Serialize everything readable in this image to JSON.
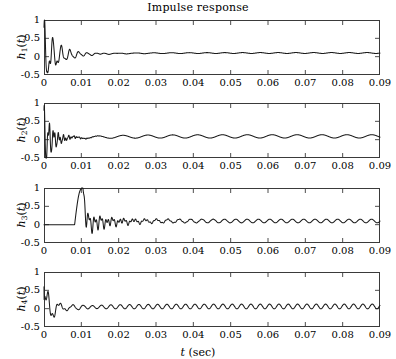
{
  "figure": {
    "title": "Impulse response",
    "xlabel_var": "t",
    "xlabel_unit": "(sec)",
    "line_color": "#1a1a1a",
    "axis_color": "#3a3a3a",
    "background": "#ffffff"
  },
  "axes": {
    "xticklabels": [
      "0",
      "0.01",
      "0.02",
      "0.03",
      "0.04",
      "0.05",
      "0.06",
      "0.07",
      "0.08",
      "0.09"
    ],
    "xtickvalues": [
      0,
      0.01,
      0.02,
      0.03,
      0.04,
      0.05,
      0.06,
      0.07,
      0.08,
      0.09
    ],
    "yticklabels": [
      "1",
      "0.5",
      "0",
      "-0.5"
    ],
    "ytickvalues": [
      1,
      0.5,
      0,
      -0.5
    ],
    "xlim": [
      0,
      0.09
    ],
    "ylim": [
      -0.5,
      1
    ]
  },
  "panels": [
    {
      "label_base": "h",
      "label_sub": "1",
      "label_var": "t",
      "name": "h1"
    },
    {
      "label_base": "h",
      "label_sub": "2",
      "label_var": "t",
      "name": "h2"
    },
    {
      "label_base": "h",
      "label_sub": "3",
      "label_var": "t",
      "name": "h3"
    },
    {
      "label_base": "h",
      "label_sub": "4",
      "label_var": "t",
      "name": "h4"
    }
  ],
  "chart_data": {
    "type": "line",
    "title": "Impulse response",
    "xlabel": "t (sec)",
    "ylabel": "h_i(t)",
    "xlim": [
      0,
      0.09
    ],
    "ylim": [
      -0.5,
      1
    ],
    "grid": false,
    "legend": "none",
    "n_subplots": 4,
    "shared_x": true,
    "x_tick_labels": [
      "0",
      "0.01",
      "0.02",
      "0.03",
      "0.04",
      "0.05",
      "0.06",
      "0.07",
      "0.08",
      "0.09"
    ],
    "y_tick_labels": [
      "1",
      "0.5",
      "0",
      "-0.5"
    ],
    "series": [
      {
        "name": "h1(t)",
        "ylabel": "h_1(t)",
        "description": "Damped oscillatory impulse response starting near 0.8, decaying to a small steady ripple near 0.1",
        "model": {
          "onset": 0.0,
          "initial_value": 0.8,
          "components": [
            {
              "amp": 0.62,
              "freq_hz": 430,
              "decay_tau": 0.0042,
              "phase": 1.5708
            },
            {
              "amp": 0.34,
              "freq_hz": 900,
              "decay_tau": 0.003,
              "phase": 0.6
            },
            {
              "amp": 0.16,
              "freq_hz": 1500,
              "decay_tau": 0.0016,
              "phase": 0.0
            }
          ],
          "tail_offset": 0.1,
          "tail_ripple_amp": 0.012,
          "tail_ripple_freq_hz": 210
        }
      },
      {
        "name": "h2(t)",
        "ylabel": "h_2(t)",
        "description": "Fast-decaying oscillation from 0.8 settling to a slow low-amplitude ripple around 0.1",
        "model": {
          "onset": 0.0,
          "initial_value": 0.8,
          "components": [
            {
              "amp": 0.7,
              "freq_hz": 760,
              "decay_tau": 0.0022,
              "phase": 1.5708
            },
            {
              "amp": 0.26,
              "freq_hz": 1400,
              "decay_tau": 0.003,
              "phase": 0.3
            },
            {
              "amp": 0.1,
              "freq_hz": 2100,
              "decay_tau": 0.0042,
              "phase": 0.9
            }
          ],
          "tail_offset": 0.09,
          "tail_ripple_amp": 0.045,
          "tail_ripple_freq_hz": 150
        }
      },
      {
        "name": "h3(t)",
        "ylabel": "h_3(t)",
        "description": "Delayed impulse: flat at zero until about 0.008 s, sharp peak of 0.95 at 0.010 s, then decaying ringing to a ripple near 0.1",
        "model": {
          "onset": 0.0082,
          "peak_time": 0.01,
          "peak_value": 0.95,
          "pre_onset_value": 0.0,
          "components": [
            {
              "amp": 0.3,
              "freq_hz": 620,
              "decay_tau": 0.0055,
              "phase": 0.0
            },
            {
              "amp": 0.16,
              "freq_hz": 1250,
              "decay_tau": 0.0085,
              "phase": 0.8
            }
          ],
          "tail_offset": 0.1,
          "tail_ripple_amp": 0.05,
          "tail_ripple_freq_hz": 330
        }
      },
      {
        "name": "h4(t)",
        "ylabel": "h_4(t)",
        "description": "Starts at 0.6, dips to -0.5, rebounds to 0.45 near 0.0035 s, then persistent small ripple around 0.05 rising toward 0.1",
        "model": {
          "onset": 0.0,
          "initial_value": 0.6,
          "first_min_time": 0.0012,
          "first_min_value": -0.5,
          "second_max_time": 0.0036,
          "second_max_value": 0.45,
          "components": [
            {
              "amp": 0.55,
              "freq_hz": 300,
              "decay_tau": 0.003,
              "phase": 0.0
            },
            {
              "amp": 0.22,
              "freq_hz": 900,
              "decay_tau": 0.0025,
              "phase": 1.2
            }
          ],
          "tail_offset": 0.06,
          "tail_ripple_amp": 0.065,
          "tail_ripple_freq_hz": 400
        }
      }
    ]
  }
}
